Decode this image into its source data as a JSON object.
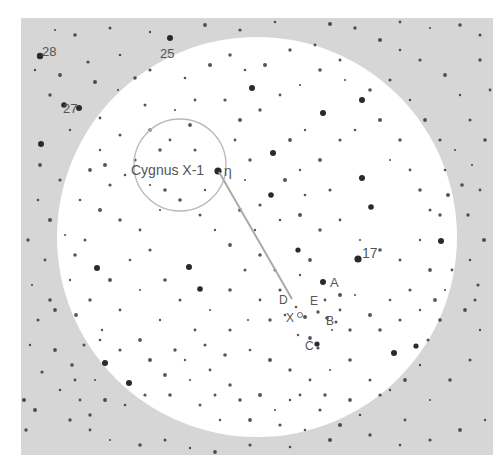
{
  "figure": {
    "width": 501,
    "height": 462,
    "frame": {
      "x": 21,
      "y": 18,
      "w": 472,
      "h": 437
    },
    "colors": {
      "page": "#ffffff",
      "field_background": "#d6d6d6",
      "bright_disk": "#ffffff",
      "star": "#2a2a2a",
      "label": "#555555",
      "pointer_line": "#aaaaaa",
      "finder_circle": "#b8b8b8"
    },
    "bright_disk": {
      "cx": 257,
      "cy": 237,
      "r": 200
    },
    "finder_circle": {
      "cx": 180,
      "cy": 165,
      "r": 46
    },
    "pointer_line": {
      "x1": 219,
      "y1": 172,
      "x2": 292,
      "y2": 299
    }
  },
  "labels": [
    {
      "id": "star-28",
      "text": "28",
      "x": 42,
      "y": 56,
      "size": 13
    },
    {
      "id": "star-25",
      "text": "25",
      "x": 160,
      "y": 58,
      "size": 13
    },
    {
      "id": "star-27",
      "text": "27",
      "x": 63,
      "y": 113,
      "size": 13
    },
    {
      "id": "cygnus-x1",
      "text": "Cygnus X-1",
      "x": 131,
      "y": 175,
      "size": 14
    },
    {
      "id": "eta",
      "text": "η",
      "x": 224,
      "y": 176,
      "size": 14
    },
    {
      "id": "star-17",
      "text": "17",
      "x": 362,
      "y": 258,
      "size": 14
    },
    {
      "id": "star-A",
      "text": "A",
      "x": 330,
      "y": 287,
      "size": 13
    },
    {
      "id": "star-D",
      "text": "D",
      "x": 279,
      "y": 304,
      "size": 12
    },
    {
      "id": "star-E",
      "text": "E",
      "x": 310,
      "y": 305,
      "size": 12
    },
    {
      "id": "star-X",
      "text": "X",
      "x": 286,
      "y": 322,
      "size": 12
    },
    {
      "id": "star-B",
      "text": "B",
      "x": 326,
      "y": 325,
      "size": 12
    },
    {
      "id": "star-C",
      "text": "C",
      "x": 305,
      "y": 350,
      "size": 12
    }
  ],
  "bright_stars": [
    [
      40,
      56,
      3.2
    ],
    [
      170,
      38,
      3
    ],
    [
      79,
      108,
      3
    ],
    [
      218,
      171,
      3.6
    ],
    [
      358,
      259,
      3.6
    ],
    [
      323,
      282,
      3
    ],
    [
      252,
      88,
      3
    ],
    [
      273,
      153,
      3
    ],
    [
      362,
      100,
      3
    ],
    [
      362,
      178,
      3
    ],
    [
      323,
      113,
      3
    ],
    [
      271,
      195,
      2.8
    ],
    [
      371,
      207,
      2.8
    ],
    [
      97,
      268,
      3
    ],
    [
      64,
      105,
      2.8
    ],
    [
      41,
      144,
      3
    ],
    [
      298,
      250,
      2.6
    ],
    [
      394,
      353,
      3
    ],
    [
      441,
      241,
      3
    ],
    [
      416,
      346,
      2.6
    ],
    [
      105,
      363,
      3
    ],
    [
      129,
      383,
      3
    ],
    [
      317,
      344,
      2.6
    ],
    [
      189,
      267,
      3
    ],
    [
      200,
      289,
      2.8
    ]
  ],
  "stars": [
    [
      55,
      30
    ],
    [
      75,
      35
    ],
    [
      110,
      28
    ],
    [
      150,
      32
    ],
    [
      205,
      25
    ],
    [
      240,
      30
    ],
    [
      275,
      22
    ],
    [
      330,
      24
    ],
    [
      355,
      28
    ],
    [
      400,
      22
    ],
    [
      430,
      28
    ],
    [
      460,
      25
    ],
    [
      480,
      35
    ],
    [
      35,
      70
    ],
    [
      60,
      75
    ],
    [
      88,
      62
    ],
    [
      120,
      55
    ],
    [
      95,
      82
    ],
    [
      50,
      95
    ],
    [
      100,
      118
    ],
    [
      118,
      90
    ],
    [
      135,
      78
    ],
    [
      145,
      105
    ],
    [
      70,
      130
    ],
    [
      40,
      165
    ],
    [
      60,
      180
    ],
    [
      38,
      200
    ],
    [
      50,
      220
    ],
    [
      28,
      240
    ],
    [
      45,
      260
    ],
    [
      32,
      285
    ],
    [
      50,
      300
    ],
    [
      38,
      320
    ],
    [
      30,
      345
    ],
    [
      55,
      350
    ],
    [
      42,
      372
    ],
    [
      60,
      390
    ],
    [
      35,
      410
    ],
    [
      70,
      420
    ],
    [
      90,
      430
    ],
    [
      110,
      440
    ],
    [
      140,
      445
    ],
    [
      165,
      440
    ],
    [
      190,
      448
    ],
    [
      215,
      452
    ],
    [
      250,
      445
    ],
    [
      290,
      447
    ],
    [
      330,
      440
    ],
    [
      370,
      435
    ],
    [
      405,
      420
    ],
    [
      430,
      400
    ],
    [
      450,
      380
    ],
    [
      470,
      360
    ],
    [
      480,
      330
    ],
    [
      465,
      310
    ],
    [
      478,
      285
    ],
    [
      470,
      260
    ],
    [
      484,
      240
    ],
    [
      468,
      215
    ],
    [
      480,
      190
    ],
    [
      472,
      165
    ],
    [
      485,
      140
    ],
    [
      470,
      120
    ],
    [
      460,
      95
    ],
    [
      445,
      75
    ],
    [
      420,
      60
    ],
    [
      400,
      50
    ],
    [
      380,
      40
    ],
    [
      480,
      60
    ],
    [
      490,
      90
    ],
    [
      455,
      150
    ],
    [
      462,
      185
    ],
    [
      475,
      300
    ],
    [
      485,
      420
    ],
    [
      460,
      430
    ],
    [
      430,
      440
    ],
    [
      400,
      445
    ],
    [
      24,
      400
    ],
    [
      26,
      430
    ],
    [
      80,
      400
    ],
    [
      95,
      380
    ],
    [
      72,
      365
    ],
    [
      84,
      345
    ],
    [
      102,
      330
    ],
    [
      76,
      315
    ],
    [
      150,
      70
    ],
    [
      185,
      78
    ],
    [
      210,
      65
    ],
    [
      230,
      55
    ],
    [
      195,
      100
    ],
    [
      175,
      110
    ],
    [
      150,
      130
    ],
    [
      120,
      135
    ],
    [
      100,
      150
    ],
    [
      90,
      170
    ],
    [
      110,
      185
    ],
    [
      80,
      200
    ],
    [
      100,
      210
    ],
    [
      120,
      220
    ],
    [
      140,
      230
    ],
    [
      160,
      210
    ],
    [
      180,
      200
    ],
    [
      200,
      215
    ],
    [
      215,
      230
    ],
    [
      230,
      245
    ],
    [
      150,
      250
    ],
    [
      130,
      260
    ],
    [
      110,
      280
    ],
    [
      90,
      300
    ],
    [
      120,
      310
    ],
    [
      140,
      290
    ],
    [
      165,
      280
    ],
    [
      180,
      300
    ],
    [
      160,
      320
    ],
    [
      140,
      340
    ],
    [
      120,
      350
    ],
    [
      100,
      340
    ],
    [
      150,
      360
    ],
    [
      175,
      350
    ],
    [
      195,
      330
    ],
    [
      210,
      310
    ],
    [
      230,
      290
    ],
    [
      245,
      270
    ],
    [
      255,
      230
    ],
    [
      240,
      210
    ],
    [
      260,
      205
    ],
    [
      280,
      220
    ],
    [
      300,
      215
    ],
    [
      320,
      230
    ],
    [
      340,
      220
    ],
    [
      360,
      240
    ],
    [
      380,
      250
    ],
    [
      400,
      260
    ],
    [
      420,
      240
    ],
    [
      430,
      270
    ],
    [
      410,
      290
    ],
    [
      390,
      300
    ],
    [
      370,
      315
    ],
    [
      350,
      330
    ],
    [
      340,
      310
    ],
    [
      355,
      295
    ],
    [
      380,
      330
    ],
    [
      400,
      320
    ],
    [
      420,
      310
    ],
    [
      435,
      300
    ],
    [
      230,
      330
    ],
    [
      250,
      350
    ],
    [
      270,
      360
    ],
    [
      290,
      370
    ],
    [
      310,
      380
    ],
    [
      330,
      370
    ],
    [
      350,
      360
    ],
    [
      370,
      380
    ],
    [
      390,
      390
    ],
    [
      350,
      400
    ],
    [
      320,
      410
    ],
    [
      290,
      400
    ],
    [
      260,
      395
    ],
    [
      230,
      385
    ],
    [
      210,
      370
    ],
    [
      190,
      380
    ],
    [
      170,
      395
    ],
    [
      200,
      405
    ],
    [
      220,
      420
    ],
    [
      250,
      420
    ],
    [
      280,
      425
    ],
    [
      305,
      430
    ],
    [
      240,
      120
    ],
    [
      260,
      110
    ],
    [
      280,
      95
    ],
    [
      300,
      85
    ],
    [
      320,
      70
    ],
    [
      340,
      60
    ],
    [
      305,
      130
    ],
    [
      290,
      140
    ],
    [
      340,
      140
    ],
    [
      355,
      130
    ],
    [
      380,
      120
    ],
    [
      400,
      140
    ],
    [
      410,
      170
    ],
    [
      390,
      160
    ],
    [
      420,
      190
    ],
    [
      430,
      210
    ],
    [
      300,
      170
    ],
    [
      320,
      160
    ],
    [
      330,
      190
    ],
    [
      305,
      195
    ],
    [
      285,
      180
    ],
    [
      250,
      160
    ],
    [
      235,
      140
    ],
    [
      245,
      180
    ],
    [
      260,
      255
    ],
    [
      275,
      270
    ],
    [
      300,
      275
    ],
    [
      310,
      260
    ],
    [
      280,
      290
    ],
    [
      296,
      307
    ],
    [
      305,
      317
    ],
    [
      318,
      312
    ],
    [
      325,
      300
    ],
    [
      332,
      330
    ],
    [
      327,
      318
    ],
    [
      336,
      322
    ],
    [
      298,
      335
    ],
    [
      310,
      338
    ],
    [
      318,
      348
    ],
    [
      285,
      315
    ],
    [
      340,
      295
    ],
    [
      270,
      320
    ],
    [
      260,
      300
    ],
    [
      248,
      320
    ],
    [
      225,
      355
    ],
    [
      205,
      345
    ],
    [
      185,
      360
    ],
    [
      165,
      375
    ],
    [
      145,
      395
    ],
    [
      125,
      405
    ],
    [
      105,
      400
    ],
    [
      90,
      415
    ],
    [
      75,
      380
    ],
    [
      65,
      235
    ],
    [
      75,
      255
    ],
    [
      85,
      240
    ],
    [
      70,
      280
    ],
    [
      55,
      310
    ],
    [
      135,
      160
    ],
    [
      125,
      175
    ],
    [
      105,
      165
    ],
    [
      160,
      150
    ],
    [
      170,
      140
    ],
    [
      150,
      185
    ],
    [
      165,
      190
    ],
    [
      195,
      150
    ],
    [
      205,
      190
    ],
    [
      190,
      125
    ],
    [
      225,
      100
    ],
    [
      245,
      70
    ],
    [
      265,
      65
    ],
    [
      290,
      50
    ],
    [
      315,
      45
    ],
    [
      345,
      80
    ],
    [
      370,
      90
    ],
    [
      390,
      80
    ],
    [
      410,
      100
    ],
    [
      425,
      120
    ],
    [
      440,
      140
    ],
    [
      445,
      170
    ],
    [
      448,
      195
    ],
    [
      440,
      215
    ],
    [
      452,
      270
    ],
    [
      445,
      290
    ],
    [
      440,
      320
    ],
    [
      428,
      340
    ],
    [
      420,
      365
    ],
    [
      405,
      380
    ],
    [
      380,
      395
    ],
    [
      360,
      415
    ],
    [
      340,
      425
    ],
    [
      325,
      395
    ],
    [
      300,
      395
    ],
    [
      275,
      410
    ],
    [
      240,
      400
    ],
    [
      215,
      395
    ]
  ]
}
